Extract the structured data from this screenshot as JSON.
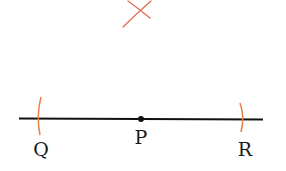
{
  "diagram": {
    "colors": {
      "line": "#111111",
      "arc": "#e8804a",
      "cross": "#e06a50",
      "text": "#1a1a1a"
    },
    "points": [
      {
        "id": "Q",
        "label": "Q"
      },
      {
        "id": "P",
        "label": "P"
      },
      {
        "id": "R",
        "label": "R"
      }
    ]
  }
}
